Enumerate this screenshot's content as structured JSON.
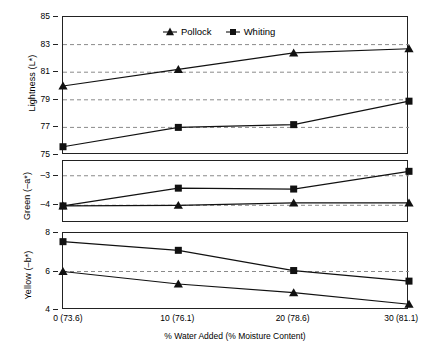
{
  "chart_data": {
    "type": "line",
    "title": "",
    "xlabel": "% Water Added (% Moisture Content)",
    "x": [
      0,
      10,
      20,
      30
    ],
    "xtick_labels": [
      "0 (73.6)",
      "10 (76.1)",
      "20 (78.6)",
      "30 (81.1)"
    ],
    "legend": [
      "Pollock",
      "Whiting"
    ],
    "legend_position": "top-center",
    "grid": true,
    "panels": [
      {
        "ylabel": "Lightness (L*)",
        "ylim": [
          75,
          85
        ],
        "yticks": [
          75,
          77,
          79,
          81,
          83,
          85
        ],
        "ytick_labels": [
          "75",
          "77",
          "79",
          "81",
          "83",
          "85"
        ],
        "gridlines": [
          77,
          79,
          81,
          83
        ],
        "series": [
          {
            "name": "Pollock",
            "marker": "triangle",
            "values": [
              80.0,
              81.2,
              82.4,
              82.7
            ]
          },
          {
            "name": "Whiting",
            "marker": "square",
            "values": [
              75.6,
              77.0,
              77.2,
              78.9
            ]
          }
        ]
      },
      {
        "ylabel": "Green (–a*)",
        "ylim": [
          -4.6,
          -2.5
        ],
        "yticks": [
          -3,
          -4
        ],
        "ytick_labels": [
          "–3",
          "–4"
        ],
        "gridlines": [
          -3,
          -4
        ],
        "series": [
          {
            "name": "Pollock",
            "marker": "triangle",
            "values": [
              -4.02,
              -4.0,
              -3.92,
              -3.92
            ]
          },
          {
            "name": "Whiting",
            "marker": "square",
            "values": [
              -4.02,
              -3.42,
              -3.45,
              -2.85
            ]
          }
        ]
      },
      {
        "ylabel": "Yellow (–b*)",
        "ylim": [
          4,
          8
        ],
        "yticks": [
          8,
          6,
          4
        ],
        "ytick_labels": [
          "8",
          "6",
          "4"
        ],
        "gridlines": [
          6
        ],
        "series": [
          {
            "name": "Pollock",
            "marker": "triangle",
            "values": [
              6.0,
              5.35,
              4.9,
              4.3
            ]
          },
          {
            "name": "Whiting",
            "marker": "square",
            "values": [
              7.55,
              7.1,
              6.05,
              5.5
            ]
          }
        ]
      }
    ],
    "colors": {
      "line": "#111111",
      "grid": "#8a8a8a",
      "axis": "#222222",
      "background": "#ffffff"
    }
  }
}
